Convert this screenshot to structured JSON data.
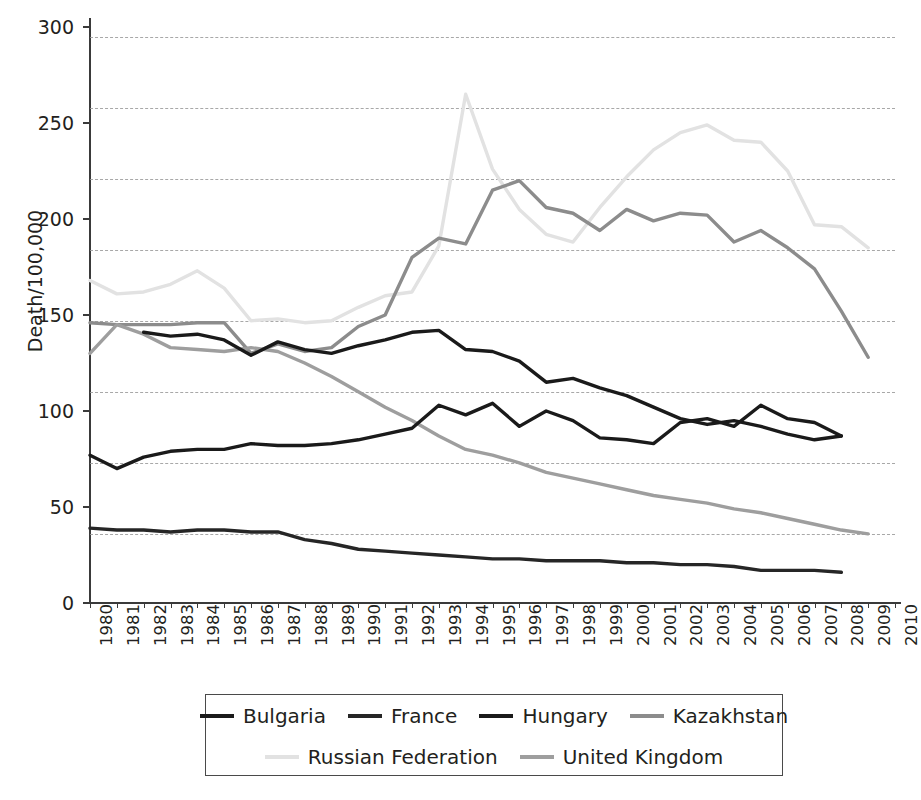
{
  "chart_data": {
    "type": "line",
    "title": "",
    "xlabel": "",
    "ylabel": "Death/100,000",
    "x": [
      1980,
      1981,
      1982,
      1983,
      1984,
      1985,
      1986,
      1987,
      1988,
      1989,
      1990,
      1991,
      1992,
      1993,
      1994,
      1995,
      1996,
      1997,
      1998,
      1999,
      2000,
      2001,
      2002,
      2003,
      2004,
      2005,
      2006,
      2007,
      2008,
      2009,
      2010
    ],
    "xlim": [
      1980,
      2010
    ],
    "ylim": [
      0,
      300
    ],
    "yticks": [
      0,
      50,
      100,
      150,
      200,
      250,
      300
    ],
    "xticks": [
      "1980",
      "1981",
      "1982",
      "1983",
      "1984",
      "1985",
      "1986",
      "1987",
      "1988",
      "1989",
      "1990",
      "1991",
      "1992",
      "1993",
      "1994",
      "1995",
      "1996",
      "1997",
      "1998",
      "1999",
      "2000",
      "2001",
      "2002",
      "2003",
      "2004",
      "2005",
      "2006",
      "2007",
      "2008",
      "2009",
      "2010"
    ],
    "grid": true,
    "grid_style": "dashed-horizontal",
    "legend_position": "bottom",
    "series": [
      {
        "name": "Bulgaria",
        "color": "#1a1a1a",
        "width": 3.4,
        "x": [
          1980,
          1981,
          1982,
          1983,
          1984,
          1985,
          1986,
          1987,
          1988,
          1989,
          1990,
          1991,
          1992,
          1993,
          1994,
          1995,
          1996,
          1997,
          1998,
          1999,
          2000,
          2001,
          2002,
          2003,
          2004,
          2005,
          2006,
          2007,
          2008
        ],
        "values": [
          77,
          70,
          76,
          79,
          80,
          80,
          83,
          82,
          82,
          83,
          85,
          88,
          91,
          103,
          98,
          104,
          92,
          100,
          95,
          86,
          85,
          83,
          94,
          96,
          92,
          103,
          96,
          94,
          87
        ]
      },
      {
        "name": "France",
        "color": "#262626",
        "width": 3.4,
        "x": [
          1980,
          1981,
          1982,
          1983,
          1984,
          1985,
          1986,
          1987,
          1988,
          1989,
          1990,
          1991,
          1992,
          1993,
          1994,
          1995,
          1996,
          1997,
          1998,
          1999,
          2000,
          2001,
          2002,
          2003,
          2004,
          2005,
          2006,
          2007,
          2008
        ],
        "values": [
          39,
          38,
          38,
          37,
          38,
          38,
          37,
          37,
          33,
          31,
          28,
          27,
          26,
          25,
          24,
          23,
          23,
          22,
          22,
          22,
          21,
          21,
          20,
          20,
          19,
          17,
          17,
          17,
          16
        ]
      },
      {
        "name": "Hungary",
        "color": "#1a1a1a",
        "width": 3.4,
        "x": [
          1982,
          1983,
          1984,
          1985,
          1986,
          1987,
          1988,
          1989,
          1990,
          1991,
          1992,
          1993,
          1994,
          1995,
          1996,
          1997,
          1998,
          1999,
          2000,
          2001,
          2002,
          2003,
          2004,
          2005,
          2006,
          2007,
          2008
        ],
        "values": [
          141,
          139,
          140,
          137,
          129,
          136,
          132,
          130,
          134,
          137,
          141,
          142,
          132,
          131,
          126,
          115,
          117,
          112,
          108,
          102,
          96,
          93,
          95,
          92,
          88,
          85,
          87
        ]
      },
      {
        "name": "Kazakhstan",
        "color": "#8c8c8c",
        "width": 3.4,
        "x": [
          1980,
          1981,
          1982,
          1983,
          1984,
          1985,
          1986,
          1987,
          1988,
          1989,
          1990,
          1991,
          1992,
          1993,
          1994,
          1995,
          1996,
          1997,
          1998,
          1999,
          2000,
          2001,
          2002,
          2003,
          2004,
          2005,
          2006,
          2007,
          2008,
          2009
        ],
        "values": [
          146,
          145,
          145,
          145,
          146,
          146,
          130,
          135,
          131,
          133,
          144,
          150,
          180,
          190,
          187,
          215,
          220,
          206,
          203,
          194,
          205,
          199,
          203,
          202,
          188,
          194,
          185,
          174,
          152,
          128
        ]
      },
      {
        "name": "Russian Federation",
        "color": "#e2e2e2",
        "width": 3.4,
        "x": [
          1980,
          1981,
          1982,
          1983,
          1984,
          1985,
          1986,
          1987,
          1988,
          1989,
          1990,
          1991,
          1992,
          1993,
          1994,
          1995,
          1996,
          1997,
          1998,
          1999,
          2000,
          2001,
          2002,
          2003,
          2004,
          2005,
          2006,
          2007,
          2008,
          2009
        ],
        "values": [
          168,
          161,
          162,
          166,
          173,
          164,
          147,
          148,
          146,
          147,
          154,
          160,
          162,
          186,
          265,
          226,
          205,
          192,
          188,
          206,
          222,
          236,
          245,
          249,
          241,
          240,
          225,
          197,
          196,
          185
        ]
      },
      {
        "name": "United Kingdom",
        "color": "#9e9e9e",
        "width": 3.4,
        "x": [
          1980,
          1981,
          1982,
          1983,
          1984,
          1985,
          1986,
          1987,
          1988,
          1989,
          1990,
          1991,
          1992,
          1993,
          1994,
          1995,
          1996,
          1997,
          1998,
          1999,
          2000,
          2001,
          2002,
          2003,
          2004,
          2005,
          2006,
          2007,
          2008,
          2009
        ],
        "values": [
          130,
          145,
          140,
          133,
          132,
          131,
          133,
          131,
          125,
          118,
          110,
          102,
          95,
          87,
          80,
          77,
          73,
          68,
          65,
          62,
          59,
          56,
          54,
          52,
          49,
          47,
          44,
          41,
          38,
          36
        ]
      }
    ]
  },
  "legend": {
    "rows": [
      [
        {
          "label": "Bulgaria",
          "color": "#1a1a1a"
        },
        {
          "label": "France",
          "color": "#262626"
        },
        {
          "label": "Hungary",
          "color": "#1a1a1a"
        },
        {
          "label": "Kazakhstan",
          "color": "#8c8c8c"
        }
      ],
      [
        {
          "label": "Russian Federation",
          "color": "#e2e2e2"
        },
        {
          "label": "United Kingdom",
          "color": "#9e9e9e"
        }
      ]
    ]
  }
}
